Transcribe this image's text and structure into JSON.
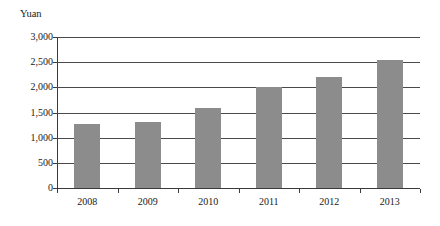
{
  "chart_data": {
    "type": "bar",
    "title": "",
    "subtitle": "",
    "xlabel": "",
    "ylabel": "Yuan",
    "unit_caption": "Yuan",
    "categories": [
      "2008",
      "2009",
      "2010",
      "2011",
      "2012",
      "2013"
    ],
    "values": [
      1270,
      1320,
      1590,
      2000,
      2210,
      2540
    ],
    "series": [
      {
        "name": "Yuan",
        "values": [
          1270,
          1320,
          1590,
          2000,
          2210,
          2540
        ]
      }
    ],
    "ylim": [
      0,
      3000
    ],
    "ytick_values": [
      0,
      500,
      1000,
      1500,
      2000,
      2500,
      3000
    ],
    "ytick_labels": [
      "0",
      "500",
      "1,000",
      "1,500",
      "2,000",
      "2,500",
      "3,000"
    ],
    "grid": true,
    "legend": false,
    "legend_position": "none",
    "bar_color": "#8c8c8c",
    "axis_color": "#3a3a3a",
    "grid_color": "#4a4a4a",
    "background_color": "#ffffff",
    "annotations": []
  }
}
